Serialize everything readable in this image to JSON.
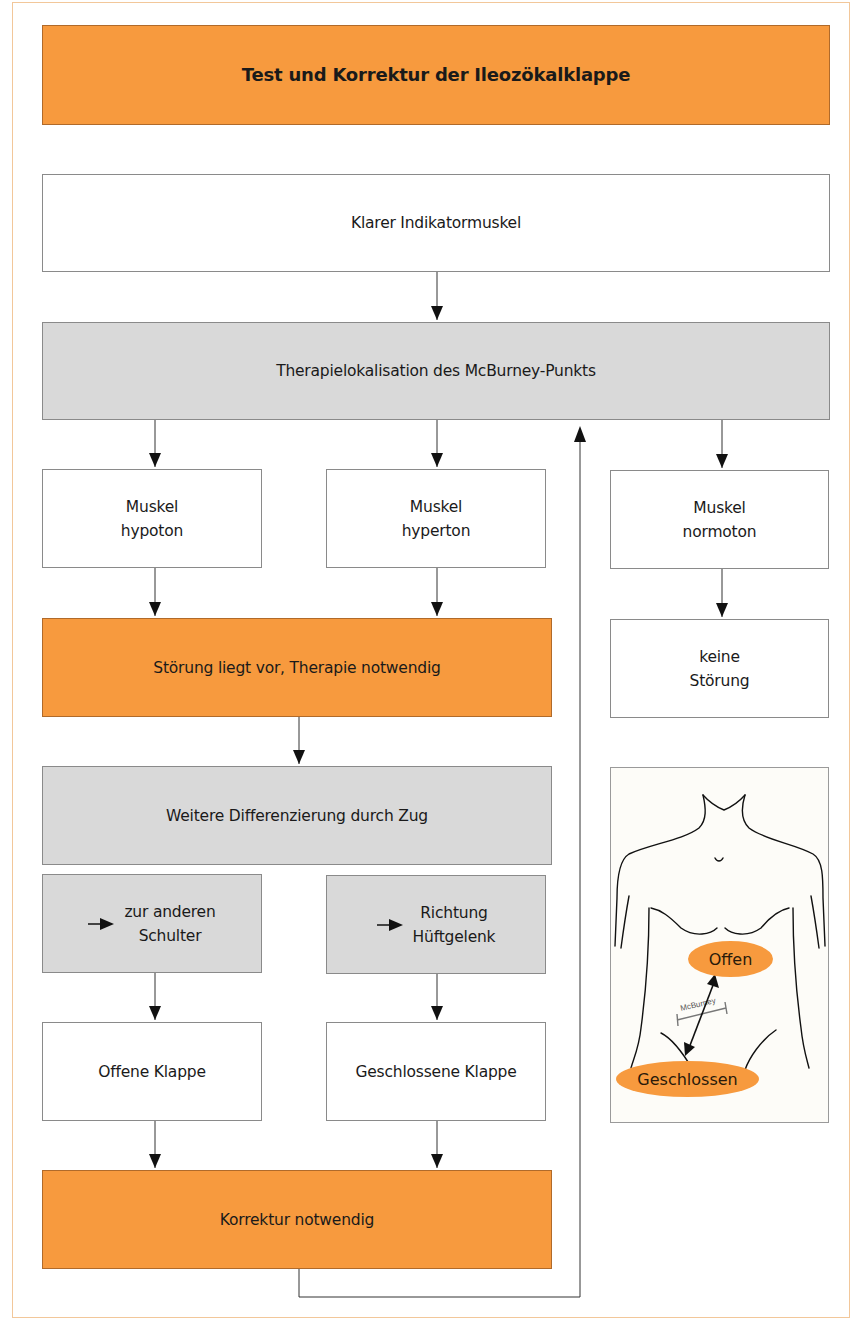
{
  "title": "Test und Korrektur der Ileozökalklappe",
  "boxes": {
    "indicator": "Klarer Indikatormuskel",
    "therapy_localisation": "Therapielokalisation des McBurney-Punkts",
    "hypoton": {
      "line1": "Muskel",
      "line2": "hypoton"
    },
    "hyperton": {
      "line1": "Muskel",
      "line2": "hyperton"
    },
    "normoton": {
      "line1": "Muskel",
      "line2": "normoton"
    },
    "disorder": "Störung liegt vor, Therapie notwendig",
    "no_disorder": {
      "line1": "keine",
      "line2": "Störung"
    },
    "differentiation": "Weitere Differenzierung durch Zug",
    "pull_shoulder": {
      "line1": "zur anderen",
      "line2": "Schulter"
    },
    "pull_hip": {
      "line1": "Richtung",
      "line2": "Hüftgelenk"
    },
    "open_valve": "Offene Klappe",
    "closed_valve": "Geschlossene Klappe",
    "correction": "Korrektur notwendig"
  },
  "figure": {
    "label_open": "Offen",
    "label_closed": "Geschlossen",
    "label_mcburney": "McBurney"
  },
  "colors": {
    "orange": "#f79a3e",
    "gray": "#d9d9d9",
    "border": "#8a8a8a",
    "frame": "#f2c79a"
  }
}
